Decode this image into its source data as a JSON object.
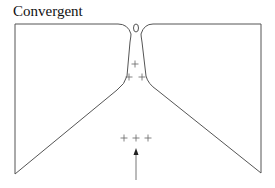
{
  "title": "Convergent",
  "diagram": {
    "type": "convergent-boundary",
    "stroke_color": "#555555",
    "markers": {
      "upper_plus_signs": [
        [
          135,
          64
        ],
        [
          129,
          77
        ],
        [
          142,
          77
        ]
      ],
      "lower_plus_signs": [
        [
          124,
          138
        ],
        [
          136,
          138
        ],
        [
          148,
          138
        ]
      ],
      "plus_glyph": "+"
    },
    "arrow": {
      "direction": "up",
      "x": 136,
      "y_start": 180,
      "y_end": 149
    },
    "oval": {
      "cx": 136,
      "cy": 28,
      "rx": 2.5,
      "ry": 4
    }
  }
}
